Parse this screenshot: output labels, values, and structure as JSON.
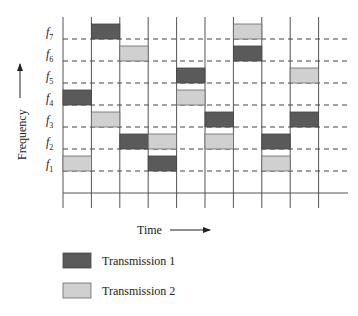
{
  "diagram": {
    "type": "frequency-hopping-time-frequency-grid",
    "y_axis_label": "Frequency",
    "x_axis_label": "Time",
    "frequencies": [
      "f1",
      "f2",
      "f3",
      "f4",
      "f5",
      "f6",
      "f7"
    ],
    "time_slots": 9,
    "colors": {
      "transmission_1": "#5a5a5a",
      "transmission_2": "#d0d0d0",
      "grid": "#555555"
    },
    "transmissions": [
      {
        "name": "Transmission 1",
        "color": "#5a5a5a",
        "hops": [
          4,
          7,
          2,
          1,
          5,
          3,
          6,
          2,
          3
        ]
      },
      {
        "name": "Transmission 2",
        "color": "#d0d0d0",
        "hops": [
          1,
          3,
          6,
          2,
          4,
          2,
          7,
          1,
          5
        ]
      }
    ]
  },
  "legend": {
    "items": [
      {
        "label": "Transmission 1",
        "color": "#5a5a5a"
      },
      {
        "label": "Transmission 2",
        "color": "#d0d0d0"
      }
    ]
  }
}
